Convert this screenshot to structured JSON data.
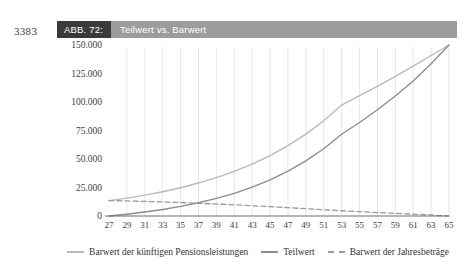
{
  "page_number": "3383",
  "caption": {
    "tag": "ABB. 72:",
    "title": "Teilwert vs. Barwert"
  },
  "legend": {
    "position": "bottom",
    "items": [
      {
        "label": "Barwert der künftigen Pensionsleistungen",
        "style": "solid",
        "color": "#b9b9b9"
      },
      {
        "label": "Teilwert",
        "style": "solid",
        "color": "#8d8d8d"
      },
      {
        "label": "Barwert der Jahresbeträge",
        "style": "dashed",
        "color": "#9a9a9a"
      }
    ]
  },
  "chart_data": {
    "type": "line",
    "title": "Teilwert vs. Barwert",
    "xlabel": "",
    "ylabel": "",
    "grid": "vertical",
    "xlim": [
      27,
      65
    ],
    "ylim": [
      0,
      150000
    ],
    "yticks": [
      0,
      25000,
      50000,
      75000,
      100000,
      125000,
      150000
    ],
    "ytick_labels": [
      "0",
      "25.000",
      "50.000",
      "75.000",
      "100.000",
      "125.000",
      "150.000"
    ],
    "x": [
      27,
      29,
      31,
      33,
      35,
      37,
      39,
      41,
      43,
      45,
      47,
      49,
      51,
      53,
      55,
      57,
      59,
      61,
      63,
      65
    ],
    "xtick_labels": [
      "27",
      "29",
      "31",
      "33",
      "35",
      "37",
      "39",
      "41",
      "43",
      "45",
      "47",
      "49",
      "51",
      "53",
      "55",
      "57",
      "59",
      "61",
      "63",
      "65"
    ],
    "series": [
      {
        "name": "Barwert der künftigen Pensionsleistungen",
        "style": "solid",
        "color": "#b9b9b9",
        "values": [
          13500,
          15700,
          18300,
          21300,
          24800,
          28900,
          33600,
          39100,
          45500,
          53000,
          61700,
          71800,
          83600,
          97300,
          105500,
          113800,
          122500,
          131500,
          140800,
          150000
        ]
      },
      {
        "name": "Teilwert",
        "style": "solid",
        "color": "#8d8d8d",
        "values": [
          0,
          1600,
          3500,
          5700,
          8400,
          11600,
          15400,
          19900,
          25300,
          31700,
          39300,
          48300,
          59000,
          71700,
          82000,
          93200,
          105300,
          118400,
          133600,
          150000
        ]
      },
      {
        "name": "Barwert der Jahresbeträge",
        "style": "dashed",
        "color": "#9a9a9a",
        "values": [
          13500,
          13200,
          12800,
          12300,
          11800,
          11200,
          10500,
          9800,
          9000,
          8200,
          7300,
          6400,
          5500,
          4600,
          3800,
          3000,
          2300,
          1600,
          900,
          0
        ]
      }
    ]
  }
}
